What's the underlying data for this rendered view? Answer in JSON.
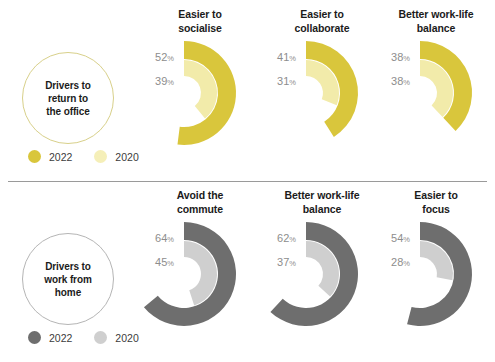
{
  "chart_data": {
    "type": "pie",
    "legend_position": "bottom-left",
    "series_names": [
      "2022",
      "2020"
    ],
    "sections": [
      {
        "id": "office",
        "label": "Drivers to\nreturn to\nthe office",
        "label_lines": [
          "Drivers to",
          "return to",
          "the office"
        ],
        "color_2022": "#d9c63c",
        "color_2020": "#f2ebaa",
        "circle_border": "#d8d08a",
        "legend": [
          {
            "name": "2022",
            "color": "#d9c63c"
          },
          {
            "name": "2020",
            "color": "#f5efb8"
          }
        ],
        "categories": [
          "Easier to socialise",
          "Easier to collaborate",
          "Better work-life balance"
        ],
        "charts": [
          {
            "title_lines": [
              "Easier to",
              "socialise"
            ],
            "values": [
              {
                "year": "2022",
                "value": 52,
                "display": "52",
                "unit": "%"
              },
              {
                "year": "2020",
                "value": 39,
                "display": "39",
                "unit": "%"
              }
            ]
          },
          {
            "title_lines": [
              "Easier to",
              "collaborate"
            ],
            "values": [
              {
                "year": "2022",
                "value": 41,
                "display": "41",
                "unit": "%"
              },
              {
                "year": "2020",
                "value": 31,
                "display": "31",
                "unit": "%"
              }
            ]
          },
          {
            "title_lines": [
              "Better work-life",
              "balance"
            ],
            "values": [
              {
                "year": "2022",
                "value": 38,
                "display": "38",
                "unit": "%"
              },
              {
                "year": "2020",
                "value": 38,
                "display": "38",
                "unit": "%"
              }
            ]
          }
        ]
      },
      {
        "id": "home",
        "label": "Drivers to\nwork from\nhome",
        "label_lines": [
          "Drivers to",
          "work from",
          "home"
        ],
        "color_2022": "#6e6e6e",
        "color_2020": "#cfcfcf",
        "circle_border": "#b5b5b5",
        "legend": [
          {
            "name": "2022",
            "color": "#6e6e6e"
          },
          {
            "name": "2020",
            "color": "#cfcfcf"
          }
        ],
        "categories": [
          "Avoid the commute",
          "Better work-life balance",
          "Easier to focus"
        ],
        "charts": [
          {
            "title_lines": [
              "Avoid the",
              "commute"
            ],
            "values": [
              {
                "year": "2022",
                "value": 64,
                "display": "64",
                "unit": "%"
              },
              {
                "year": "2020",
                "value": 45,
                "display": "45",
                "unit": "%"
              }
            ]
          },
          {
            "title_lines": [
              "Better work-life",
              "balance"
            ],
            "values": [
              {
                "year": "2022",
                "value": 62,
                "display": "62",
                "unit": "%"
              },
              {
                "year": "2020",
                "value": 37,
                "display": "37",
                "unit": "%"
              }
            ]
          },
          {
            "title_lines": [
              "Easier to",
              "focus"
            ],
            "values": [
              {
                "year": "2022",
                "value": 54,
                "display": "54",
                "unit": "%"
              },
              {
                "year": "2020",
                "value": 28,
                "display": "28",
                "unit": "%"
              }
            ]
          }
        ]
      }
    ]
  }
}
